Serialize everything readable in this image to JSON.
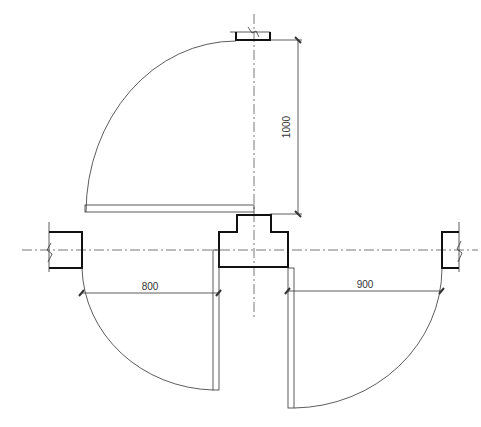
{
  "drawing": {
    "type": "architectural door swing plan",
    "dimensions": {
      "top_door_clearance": "1000",
      "left_door_width": "800",
      "right_door_width": "900"
    },
    "colors": {
      "line": "#333333",
      "wall": "#111111",
      "background": "#ffffff"
    }
  }
}
